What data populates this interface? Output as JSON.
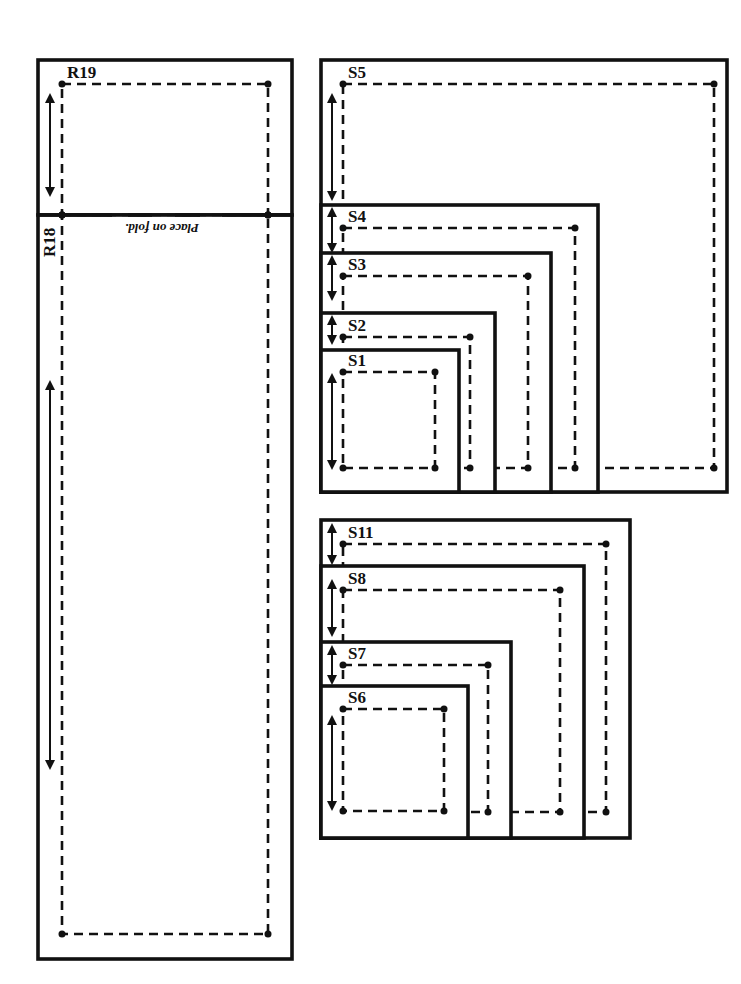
{
  "page": {
    "width": 741,
    "height": 984,
    "background": "#ffffff",
    "ink": "#111111"
  },
  "pieces": {
    "R19": {
      "label": "R19",
      "cut": [
        38,
        60,
        254,
        155
      ],
      "sew": [
        62,
        84,
        206,
        131
      ],
      "grain": [
        50,
        98,
        192
      ]
    },
    "R18": {
      "label": "R18",
      "cut": [
        38,
        215,
        254,
        744
      ],
      "sew": [
        62,
        215,
        206,
        719
      ],
      "grain": [
        50,
        385,
        765
      ],
      "label_rotated": true
    },
    "fold": {
      "text": "Place on fold.",
      "y": 215,
      "x1": 38,
      "x2": 292,
      "rotated_180": true
    },
    "S5": {
      "label": "S5",
      "cut": [
        321,
        60,
        406,
        432
      ],
      "sew": [
        343,
        84,
        371,
        384
      ],
      "grain": [
        332,
        98,
        196
      ]
    },
    "S4": {
      "label": "S4",
      "cut": [
        321,
        205,
        277,
        287
      ],
      "sew": [
        343,
        228,
        232,
        240
      ],
      "grain": [
        332,
        212,
        248
      ]
    },
    "S3": {
      "label": "S3",
      "cut": [
        321,
        253,
        230,
        239
      ],
      "sew": [
        343,
        276,
        185,
        192
      ],
      "grain": [
        332,
        260,
        296
      ]
    },
    "S2": {
      "label": "S2",
      "cut": [
        321,
        313,
        174,
        179
      ],
      "sew": [
        343,
        337,
        127,
        131
      ],
      "grain": [
        332,
        320,
        340
      ]
    },
    "S1": {
      "label": "S1",
      "cut": [
        321,
        350,
        138,
        142
      ],
      "sew": [
        343,
        372,
        92,
        96
      ],
      "grain": [
        332,
        378,
        465
      ]
    },
    "S11": {
      "label": "S11",
      "cut": [
        321,
        520,
        309,
        318
      ],
      "sew": [
        343,
        544,
        263,
        268
      ],
      "grain": [
        332,
        528,
        560
      ]
    },
    "S8": {
      "label": "S8",
      "cut": [
        321,
        566,
        263,
        272
      ],
      "sew": [
        343,
        590,
        217,
        222
      ],
      "grain": [
        332,
        584,
        632
      ]
    },
    "S7": {
      "label": "S7",
      "cut": [
        321,
        642,
        190,
        196
      ],
      "sew": [
        343,
        665,
        145,
        147
      ],
      "grain": [
        332,
        650,
        680
      ]
    },
    "S6": {
      "label": "S6",
      "cut": [
        321,
        686,
        147,
        152
      ],
      "sew": [
        343,
        709,
        101,
        102
      ],
      "grain": [
        332,
        720,
        806
      ]
    }
  },
  "draw_order": [
    "R19",
    "R18",
    "S5",
    "S4",
    "S3",
    "S2",
    "S1",
    "S11",
    "S8",
    "S7",
    "S6"
  ]
}
